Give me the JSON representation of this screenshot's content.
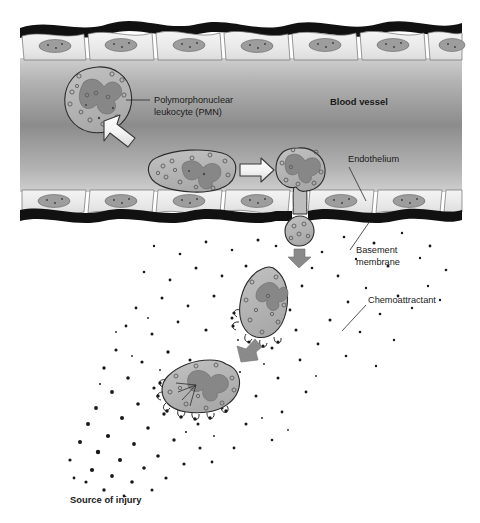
{
  "figure": {
    "width": 480,
    "height": 523
  },
  "labels": {
    "pmn_line1": "Polymorphonuclear",
    "pmn_line2": "leukocyte (PMN)",
    "blood_vessel": "Blood vessel",
    "endothelium": "Endothelium",
    "basement_line1": "Basement",
    "basement_line2": "membrane",
    "chemoattractant": "Chemoattractant",
    "source_of_injury": "Source of injury"
  },
  "colors": {
    "background": "#ffffff",
    "vessel_lumen_edge": "#c9c9c9",
    "vessel_lumen_center": "#8e8e8e",
    "endothelial_cell": "#ededed",
    "endothelial_nucleus": "#9a9a9a",
    "basement_membrane": "#111111",
    "cell_cytoplasm": "#b4b4b4",
    "cell_nucleus": "#8a8a8a",
    "cell_outline": "#2b2b2b",
    "gray_arrow": "#8a8a8a",
    "white_arrow_fill": "#f2f2f2",
    "white_arrow_stroke": "#3a3a3a",
    "particle": "#181818",
    "text": "#1a1a1a",
    "leader_line": "#2a2a2a"
  },
  "structures": {
    "top_endothelium": {
      "name": "top endothelial cell layer",
      "cell_count": 6,
      "y_top": 20,
      "y_bottom": 62
    },
    "bottom_endothelium": {
      "name": "bottom endothelial cell layer",
      "cell_count": 6,
      "y_top": 187,
      "y_bottom": 222
    },
    "vessel_lumen": {
      "name": "blood vessel lumen",
      "y_top": 60,
      "y_bottom": 190
    }
  },
  "cells": [
    {
      "id": "pmn-circulating",
      "stage": "circulating in lumen",
      "cx": 98,
      "cy": 99,
      "rx": 33,
      "ry": 32
    },
    {
      "id": "pmn-rolling",
      "stage": "margination / rolling along endothelium",
      "cx": 190,
      "cy": 170,
      "rx": 44,
      "ry": 22
    },
    {
      "id": "pmn-adherent",
      "stage": "adhesion at endothelial junction",
      "cx": 299,
      "cy": 170,
      "rx": 26,
      "ry": 22
    },
    {
      "id": "pmn-diapedesis",
      "stage": "diapedesis through basement membrane",
      "cx": 300,
      "cy": 228,
      "rx": 13,
      "ry": 16
    },
    {
      "id": "pmn-chemotaxis-1",
      "stage": "chemotaxis in tissue",
      "cx": 264,
      "cy": 302,
      "rx": 23,
      "ry": 34
    },
    {
      "id": "pmn-chemotaxis-2",
      "stage": "chemotaxis approaching injury",
      "cx": 198,
      "cy": 386,
      "rx": 40,
      "ry": 28
    }
  ],
  "arrows": [
    {
      "id": "white-arrow-diagonal",
      "type": "white-outline",
      "direction": "down-right",
      "from": [
        110,
        124
      ],
      "to": [
        150,
        155
      ]
    },
    {
      "id": "white-arrow-horizontal",
      "type": "white-outline",
      "direction": "right",
      "from": [
        237,
        170
      ],
      "to": [
        272,
        170
      ]
    },
    {
      "id": "gray-arrow-1",
      "type": "gray-solid",
      "direction": "down",
      "from": [
        299,
        243
      ],
      "to": [
        299,
        262
      ]
    },
    {
      "id": "gray-arrow-2",
      "type": "gray-solid",
      "direction": "down-left",
      "from": [
        250,
        343
      ],
      "to": [
        235,
        358
      ]
    }
  ],
  "leaders": [
    {
      "id": "pmn-leader",
      "label": "pmn_line1",
      "from": [
        148,
        100
      ],
      "to": [
        127,
        100
      ]
    },
    {
      "id": "endothelium-leader",
      "label": "endothelium",
      "from": [
        348,
        167
      ],
      "to": [
        366,
        200
      ]
    },
    {
      "id": "basement-leader",
      "label": "basement_line1",
      "from": [
        350,
        250
      ],
      "to": [
        370,
        222
      ]
    },
    {
      "id": "chemoattractant-leader",
      "label": "chemoattractant",
      "from": [
        368,
        305
      ],
      "to": [
        343,
        330
      ]
    }
  ],
  "chemoattractant_gradient": {
    "description": "particles of chemoattractant diffusing from the source of injury at lower left toward upper right",
    "source_point": [
      110,
      455
    ],
    "densest_region": "lower-left near source of injury",
    "sparsest_region": "upper-right near basement membrane"
  }
}
